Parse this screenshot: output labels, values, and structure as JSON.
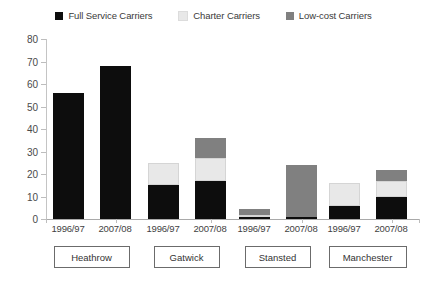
{
  "chart_data": {
    "type": "bar",
    "subtype": "stacked-grouped",
    "title": "",
    "xlabel": "",
    "ylabel": "",
    "ylim": [
      0,
      80
    ],
    "ytick_step": 10,
    "yticks": [
      0,
      10,
      20,
      30,
      40,
      50,
      60,
      70,
      80
    ],
    "ytick_labels": [
      "0",
      "10",
      "20",
      "30",
      "40",
      "50",
      "60",
      "70",
      "80"
    ],
    "grid": false,
    "legend_position": "top-center",
    "groups": [
      "Heathrow",
      "Gatwick",
      "Stansted",
      "Manchester"
    ],
    "categories": [
      "1996/97",
      "2007/08",
      "1996/97",
      "2007/08",
      "1996/97",
      "2007/08",
      "1996/97",
      "2007/08"
    ],
    "series": [
      {
        "name": "Full Service Carriers",
        "color": "#0d0d0d",
        "values": [
          56,
          68,
          15,
          17,
          1,
          1,
          6,
          10
        ]
      },
      {
        "name": "Charter Carriers",
        "color": "#e8e8e8",
        "values": [
          0,
          0,
          10,
          10,
          1,
          0,
          10,
          7
        ]
      },
      {
        "name": "Low-cost Carriers",
        "color": "#808080",
        "values": [
          0,
          0,
          0,
          9,
          2.5,
          23,
          0,
          5
        ]
      }
    ],
    "totals": [
      56,
      68,
      25,
      36,
      4.5,
      24,
      16,
      22
    ],
    "bars": [
      {
        "group": "Heathrow",
        "category": "1996/97",
        "full_service": 56,
        "charter": 0,
        "low_cost": 0,
        "total": 56
      },
      {
        "group": "Heathrow",
        "category": "2007/08",
        "full_service": 68,
        "charter": 0,
        "low_cost": 0,
        "total": 68
      },
      {
        "group": "Gatwick",
        "category": "1996/97",
        "full_service": 15,
        "charter": 10,
        "low_cost": 0,
        "total": 25
      },
      {
        "group": "Gatwick",
        "category": "2007/08",
        "full_service": 17,
        "charter": 10,
        "low_cost": 9,
        "total": 36
      },
      {
        "group": "Stansted",
        "category": "1996/97",
        "full_service": 1,
        "charter": 1,
        "low_cost": 2.5,
        "total": 4.5
      },
      {
        "group": "Stansted",
        "category": "2007/08",
        "full_service": 1,
        "charter": 0,
        "low_cost": 23,
        "total": 24
      },
      {
        "group": "Manchester",
        "category": "1996/97",
        "full_service": 6,
        "charter": 10,
        "low_cost": 0,
        "total": 16
      },
      {
        "group": "Manchester",
        "category": "2007/08",
        "full_service": 10,
        "charter": 7,
        "low_cost": 5,
        "total": 22
      }
    ]
  },
  "legend": {
    "items": [
      {
        "label": "Full Service Carriers",
        "color": "#0d0d0d"
      },
      {
        "label": "Charter Carriers",
        "color": "#e8e8e8"
      },
      {
        "label": "Low-cost Carriers",
        "color": "#808080"
      }
    ]
  },
  "axis": {
    "y_labels": [
      "80",
      "70",
      "60",
      "50",
      "40",
      "30",
      "20",
      "10",
      "0"
    ],
    "x_labels": [
      "1996/97",
      "2007/08",
      "1996/97",
      "2007/08",
      "1996/97",
      "2007/08",
      "1996/97",
      "2007/08"
    ]
  },
  "groups": [
    {
      "label": "Heathrow"
    },
    {
      "label": "Gatwick"
    },
    {
      "label": "Stansted"
    },
    {
      "label": "Manchester"
    }
  ],
  "colors": {
    "full_service": "#0d0d0d",
    "charter": "#e8e8e8",
    "low_cost": "#808080",
    "axis": "#a9a9a9",
    "text": "#3a3a3a",
    "background": "#ffffff"
  }
}
